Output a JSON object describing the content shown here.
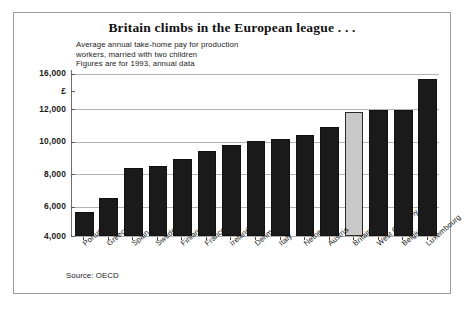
{
  "figure": {
    "title": "Britain climbs in the European league . . .",
    "subtitle_lines": [
      "Average annual take-home pay for production",
      "workers, married with two children",
      "Figures are for 1993, annual data"
    ],
    "source": "Source: OECD",
    "currency_symbol": "£",
    "colors": {
      "bar": "#1a1a1a",
      "highlight_bar": "#c9c9c9",
      "gridline": "#b3b3b3",
      "frame": "#9a9a9a",
      "text": "#1b1b1b",
      "background": "#ffffff"
    }
  },
  "chart_data": {
    "type": "bar",
    "title": "Britain climbs in the European league . . .",
    "subtitle": "Average annual take-home pay for production workers, married with two children. Figures are for 1993, annual data",
    "xlabel": "",
    "ylabel": "£",
    "categories": [
      "Portugal",
      "Greece",
      "Spain",
      "Sweden",
      "Finland",
      "France",
      "Ireland",
      "Denmark",
      "Italy",
      "Netherlands",
      "Austria",
      "Britain",
      "West Germany",
      "Belgium",
      "Luxembourg"
    ],
    "values": [
      5600,
      6500,
      8350,
      8500,
      8950,
      9400,
      9800,
      10050,
      10150,
      10400,
      10900,
      11800,
      11950,
      11950,
      15400
    ],
    "highlight_index": 11,
    "highlight_label": "Britain",
    "ytick_labels": [
      "16,000",
      "£",
      "12,000",
      "10,000",
      "8,000",
      "6,000",
      "4,000"
    ],
    "ytick_values": [
      16000,
      14000,
      12000,
      10000,
      8000,
      6000,
      4000
    ],
    "ylim": [
      4000,
      16800
    ],
    "grid": true,
    "legend": "none",
    "source": "Source: OECD"
  }
}
